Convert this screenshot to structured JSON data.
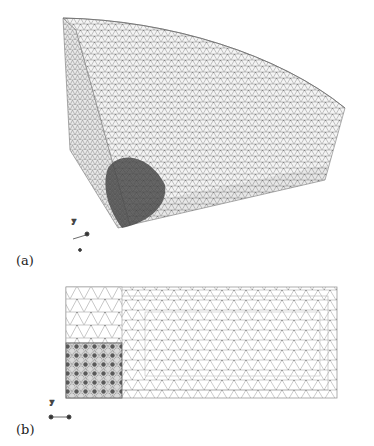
{
  "figure": {
    "panels": [
      {
        "label": "(a)",
        "description": "3D tetrahedral mesh of a quarter-cylinder sector with refined region near bottom-left corner",
        "axis_triad": {
          "labels": [
            "y",
            "x",
            "z"
          ]
        }
      },
      {
        "label": "(b)",
        "description": "2D cross-section triangular mesh, rectangular domain with refined lower-left square block",
        "axis_triad": {
          "labels": [
            "y",
            "x",
            "z"
          ]
        }
      }
    ],
    "colors": {
      "mesh_line": "#8a8a8a",
      "dense_region": "#3a3a3a",
      "background": "#ffffff"
    }
  }
}
